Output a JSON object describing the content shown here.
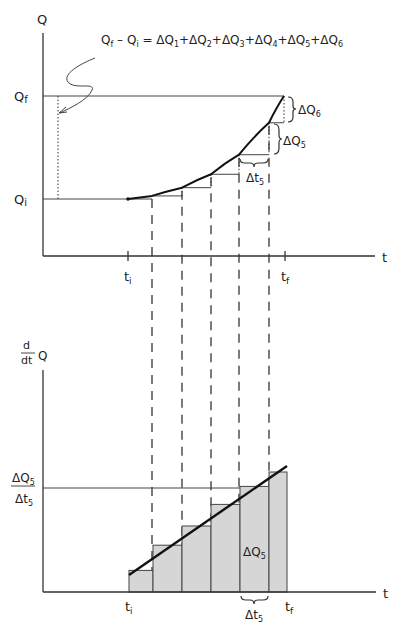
{
  "top_graph": {
    "y_axis_label": "Q",
    "x_axis_label": "t",
    "qf_label": "Q",
    "qf_sub": "f",
    "qi_label": "Q",
    "qi_sub": "i",
    "ti_label": "t",
    "ti_sub": "i",
    "tf_label": "t",
    "tf_sub": "f",
    "equation": {
      "lhs_a": "Q",
      "lhs_a_sub": "f",
      "minus": " – ",
      "lhs_b": "Q",
      "lhs_b_sub": "i",
      "equals": " = ",
      "terms": [
        {
          "text": "ΔQ",
          "sub": "1"
        },
        {
          "text": "+ΔQ",
          "sub": "2"
        },
        {
          "text": "+ΔQ",
          "sub": "3"
        },
        {
          "text": "+ΔQ",
          "sub": "4"
        },
        {
          "text": "+ΔQ",
          "sub": "5"
        },
        {
          "text": "+ΔQ",
          "sub": "6"
        }
      ]
    },
    "dq6_label": "ΔQ",
    "dq6_sub": "6",
    "dq5_label": "ΔQ",
    "dq5_sub": "5",
    "dt5_label": "Δt",
    "dt5_sub": "5"
  },
  "bottom_graph": {
    "y_axis_label_num": "d",
    "y_axis_label_den": "dt",
    "y_axis_label_q": "Q",
    "x_axis_label": "t",
    "ratio_num": "ΔQ",
    "ratio_num_sub": "5",
    "ratio_den": "Δt",
    "ratio_den_sub": "5",
    "bar_label": "ΔQ",
    "bar_label_sub": "5",
    "dt5_label": "Δt",
    "dt5_sub": "5",
    "ti_label": "t",
    "ti_sub": "i",
    "tf_label": "t",
    "tf_sub": "f",
    "bar_fill": "#d6d6d6"
  },
  "model": {
    "intervals": 6,
    "t_points": [
      0,
      1,
      2,
      3,
      4,
      5,
      6
    ],
    "q_relative": [
      0,
      0.03,
      0.11,
      0.24,
      0.43,
      0.74,
      1.0
    ],
    "rate_relative": [
      0.18,
      0.39,
      0.55,
      0.73,
      0.88,
      1.0
    ]
  }
}
